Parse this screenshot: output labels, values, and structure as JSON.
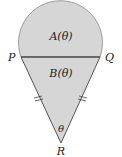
{
  "diagram": {
    "labels": {
      "region_top": "A(θ)",
      "region_bottom": "B(θ)",
      "point_left": "P",
      "point_right": "Q",
      "point_bottom": "R",
      "angle": "θ"
    },
    "colors": {
      "fill": "#d6d6d6",
      "stroke": "#6a6a6a",
      "chord": "#555555",
      "text": "#222222"
    }
  }
}
